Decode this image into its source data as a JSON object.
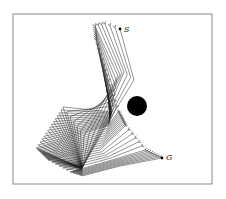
{
  "figure": {
    "frame": {
      "x": 13,
      "y": 14,
      "width": 199,
      "height": 170
    },
    "colors": {
      "frame": "#8a8a8a",
      "link": "#1a1a1a",
      "obstacle": "#000000",
      "background": "#ffffff"
    },
    "obstacle": {
      "cx": 137,
      "cy": 106,
      "r": 10
    },
    "start": {
      "label": "S",
      "x": 120,
      "y": 29,
      "label_x": 124,
      "label_y": 32
    },
    "goal": {
      "label": "G",
      "x": 162,
      "y": 158,
      "label_x": 166,
      "label_y": 160
    },
    "base": [
      82,
      168
    ],
    "keyframes": [
      {
        "j1": [
          108,
          122
        ],
        "j2": [
          134,
          80
        ],
        "tip": [
          120,
          29
        ],
        "steps": 3
      },
      {
        "j1": [
          100,
          128
        ],
        "j2": [
          124,
          72
        ],
        "tip": [
          105,
          24
        ],
        "steps": 3
      },
      {
        "j1": [
          84,
          136
        ],
        "j2": [
          118,
          76
        ],
        "tip": [
          95,
          26
        ],
        "steps": 6
      },
      {
        "j1": [
          63,
          107
        ],
        "j2": [
          112,
          112
        ],
        "tip": [
          96,
          40
        ],
        "steps": 14
      },
      {
        "j1": [
          36,
          148
        ],
        "j2": [
          108,
          126
        ],
        "tip": [
          118,
          112
        ],
        "steps": 10
      },
      {
        "j1": [
          48,
          160
        ],
        "j2": [
          100,
          150
        ],
        "tip": [
          125,
          126
        ],
        "steps": 6
      },
      {
        "j1": [
          70,
          172
        ],
        "j2": [
          112,
          160
        ],
        "tip": [
          145,
          150
        ],
        "steps": 8
      },
      {
        "j1": [
          82,
          176
        ],
        "j2": [
          120,
          166
        ],
        "tip": [
          162,
          158
        ],
        "steps": 1
      }
    ]
  }
}
